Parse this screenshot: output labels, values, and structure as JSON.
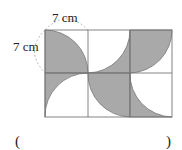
{
  "figure": {
    "label_top": "7 cm",
    "label_left": "7 cm",
    "grid": {
      "cols": 3,
      "rows": 2,
      "cell_size_cm": 7
    },
    "shade_color": "#a9a9a9",
    "line_color": "#777777"
  },
  "answer": {
    "open_paren": "(",
    "close_paren": ")"
  }
}
